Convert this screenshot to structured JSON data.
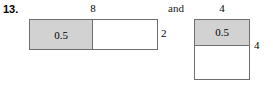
{
  "problem": {
    "number": "13.",
    "conjunction": "and"
  },
  "figures": [
    {
      "id": "left",
      "orientation": "horizontal",
      "shaded_value": "0.5",
      "top_label": "8",
      "side_label": "2"
    },
    {
      "id": "right",
      "orientation": "vertical",
      "shaded_value": "0.5",
      "top_label": "4",
      "side_label": "4"
    }
  ],
  "colors": {
    "shade_fill": "#d2d2d2",
    "stroke": "#6e6e6e",
    "text": "#000000",
    "background": "#ffffff"
  }
}
